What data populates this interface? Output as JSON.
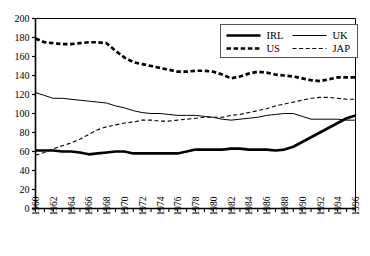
{
  "chart_data": {
    "type": "line",
    "title": "",
    "xlabel": "",
    "ylabel": "",
    "xlim": [
      1960,
      1996
    ],
    "ylim": [
      0,
      200
    ],
    "grid": false,
    "legend_position": "top-right",
    "x": [
      1960,
      1961,
      1962,
      1963,
      1964,
      1965,
      1966,
      1967,
      1968,
      1969,
      1970,
      1971,
      1972,
      1973,
      1974,
      1975,
      1976,
      1977,
      1978,
      1979,
      1980,
      1981,
      1982,
      1983,
      1984,
      1985,
      1986,
      1987,
      1988,
      1989,
      1990,
      1991,
      1992,
      1993,
      1994,
      1995,
      1996
    ],
    "xticks": [
      1960,
      1961,
      1962,
      1963,
      1964,
      1965,
      1966,
      1967,
      1968,
      1969,
      1970,
      1971,
      1972,
      1973,
      1974,
      1975,
      1976,
      1977,
      1978,
      1979,
      1980,
      1981,
      1982,
      1983,
      1984,
      1985,
      1986,
      1987,
      1988,
      1989,
      1990,
      1991,
      1992,
      1993,
      1994,
      1995,
      1996
    ],
    "xtick_labels": [
      "1960",
      "",
      "1962",
      "",
      "1964",
      "",
      "1966",
      "",
      "1968",
      "",
      "1970",
      "",
      "1972",
      "",
      "1974",
      "",
      "1976",
      "",
      "1978",
      "",
      "1980",
      "",
      "1982",
      "",
      "1984",
      "",
      "1986",
      "",
      "1988",
      "",
      "1990",
      "",
      "1992",
      "",
      "1994",
      "",
      "1996"
    ],
    "yticks": [
      0,
      20,
      40,
      60,
      80,
      100,
      120,
      140,
      160,
      180,
      200
    ],
    "ytick_labels": [
      "0",
      "20",
      "40",
      "60",
      "80",
      "100",
      "120",
      "140",
      "160",
      "180",
      "200"
    ],
    "series": [
      {
        "name": "IRL",
        "style": "thick-solid",
        "color": "#000000",
        "values": [
          61,
          61,
          61,
          60,
          60,
          59,
          57,
          58,
          59,
          60,
          60,
          58,
          58,
          58,
          58,
          58,
          58,
          60,
          62,
          62,
          62,
          62,
          63,
          63,
          62,
          62,
          62,
          61,
          62,
          65,
          70,
          75,
          80,
          85,
          90,
          95,
          98
        ]
      },
      {
        "name": "UK",
        "style": "thin-solid",
        "color": "#000000",
        "values": [
          122,
          119,
          116,
          116,
          115,
          114,
          113,
          112,
          111,
          108,
          106,
          103,
          101,
          100,
          100,
          99,
          98,
          98,
          98,
          97,
          96,
          94,
          93,
          94,
          95,
          96,
          98,
          99,
          100,
          100,
          97,
          94,
          94,
          94,
          94,
          93,
          93
        ]
      },
      {
        "name": "US",
        "style": "thick-dashed",
        "color": "#000000",
        "values": [
          179,
          175,
          174,
          173,
          173,
          174,
          175,
          175,
          174,
          166,
          159,
          154,
          152,
          150,
          148,
          146,
          144,
          144,
          145,
          145,
          144,
          141,
          137,
          139,
          142,
          144,
          143,
          141,
          140,
          139,
          137,
          135,
          134,
          136,
          138,
          138,
          138
        ]
      },
      {
        "name": "JAP",
        "style": "thin-dashed",
        "color": "#000000",
        "values": [
          56,
          59,
          63,
          66,
          69,
          73,
          78,
          83,
          86,
          88,
          90,
          91,
          93,
          93,
          92,
          92,
          93,
          94,
          95,
          96,
          96,
          96,
          98,
          99,
          101,
          103,
          105,
          108,
          110,
          112,
          114,
          116,
          117,
          117,
          116,
          115,
          115
        ]
      }
    ]
  },
  "legend": {
    "entries": [
      {
        "label": "IRL",
        "style": "thick-solid"
      },
      {
        "label": "UK",
        "style": "thin-solid"
      },
      {
        "label": "US",
        "style": "thick-dashed"
      },
      {
        "label": "JAP",
        "style": "thin-dashed"
      }
    ]
  }
}
